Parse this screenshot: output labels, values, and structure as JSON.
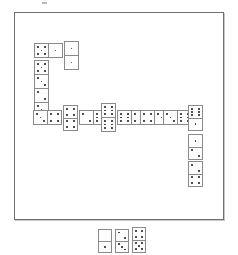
{
  "app": {
    "title": "Dominoes",
    "background_color": "#ffffff"
  },
  "board": {
    "name": "domino-playfield",
    "x": 14,
    "y": 12,
    "width": 210,
    "height": 208,
    "border_color": "#6f6f6f",
    "fill_color": "#ffffff"
  },
  "speck": {
    "x": 42,
    "y": 2,
    "width": 5,
    "height": 2,
    "color": "#b9b9b9"
  },
  "tile_style": {
    "border_color": "#8a8a8a",
    "face_color": "#fdfdfd",
    "pip_color": "#2b2b2b"
  },
  "legend": {
    "board_label": "Played chain",
    "tray_label": "Hand"
  },
  "chain": {
    "name": "played-domino-chain",
    "description": "Snake of played tiles running right across the upper-left, down the left column, along the centre row, then down the right column.",
    "tiles": [
      {
        "id": "t1",
        "name": "domino-5-1",
        "orientation": "horiz",
        "x": 34,
        "y": 43,
        "w": 29,
        "h": 15,
        "a": 5,
        "b": 1
      },
      {
        "id": "t2",
        "name": "domino-1-1",
        "orientation": "vert",
        "x": 64,
        "y": 41,
        "w": 15,
        "h": 29,
        "a": 1,
        "b": 1
      },
      {
        "id": "t3",
        "name": "domino-5-3",
        "orientation": "vert",
        "x": 34,
        "y": 60,
        "w": 15,
        "h": 29,
        "a": 5,
        "b": 3
      },
      {
        "id": "t4",
        "name": "domino-2-3",
        "orientation": "vert",
        "x": 34,
        "y": 88,
        "w": 15,
        "h": 29,
        "a": 2,
        "b": 3
      },
      {
        "id": "t5",
        "name": "domino-3-4",
        "orientation": "horiz",
        "x": 33,
        "y": 110,
        "w": 29,
        "h": 15,
        "a": 3,
        "b": 4
      },
      {
        "id": "t6",
        "name": "domino-4-4",
        "orientation": "vert",
        "x": 63,
        "y": 105,
        "w": 15,
        "h": 26,
        "a": 4,
        "b": 4
      },
      {
        "id": "t7",
        "name": "domino-2-6",
        "orientation": "horiz",
        "x": 79,
        "y": 110,
        "w": 29,
        "h": 15,
        "a": 2,
        "b": 6
      },
      {
        "id": "t8",
        "name": "domino-6-6",
        "orientation": "vert",
        "x": 101,
        "y": 103,
        "w": 15,
        "h": 29,
        "a": 6,
        "b": 6
      },
      {
        "id": "t9",
        "name": "domino-6-4",
        "orientation": "horiz",
        "x": 117,
        "y": 110,
        "w": 29,
        "h": 15,
        "a": 6,
        "b": 4
      },
      {
        "id": "t10",
        "name": "domino-4-3",
        "orientation": "horiz",
        "x": 140,
        "y": 110,
        "w": 29,
        "h": 15,
        "a": 4,
        "b": 3
      },
      {
        "id": "t11",
        "name": "domino-3-6",
        "orientation": "horiz",
        "x": 163,
        "y": 110,
        "w": 29,
        "h": 15,
        "a": 3,
        "b": 6
      },
      {
        "id": "t12",
        "name": "domino-6-1",
        "orientation": "vert",
        "x": 188,
        "y": 105,
        "w": 15,
        "h": 26,
        "a": 6,
        "b": 1
      },
      {
        "id": "t13",
        "name": "domino-1-2",
        "orientation": "vert",
        "x": 188,
        "y": 134,
        "w": 15,
        "h": 26,
        "a": 1,
        "b": 2
      },
      {
        "id": "t14",
        "name": "domino-2-4",
        "orientation": "vert",
        "x": 188,
        "y": 161,
        "w": 15,
        "h": 26,
        "a": 2,
        "b": 4
      }
    ]
  },
  "tray": {
    "name": "player-hand-tray",
    "tiles": [
      {
        "id": "h1",
        "name": "domino-0-1",
        "orientation": "vert",
        "x": 98,
        "y": 229,
        "w": 14,
        "h": 24,
        "a": 0,
        "b": 1
      },
      {
        "id": "h2",
        "name": "domino-2-3",
        "orientation": "vert",
        "x": 115,
        "y": 229,
        "w": 14,
        "h": 24,
        "a": 2,
        "b": 3
      },
      {
        "id": "h3",
        "name": "domino-4-5",
        "orientation": "vert",
        "x": 132,
        "y": 227,
        "w": 14,
        "h": 26,
        "a": 4,
        "b": 5
      }
    ]
  },
  "counts": {
    "chain_tiles": 14,
    "tray_tiles": 3
  }
}
